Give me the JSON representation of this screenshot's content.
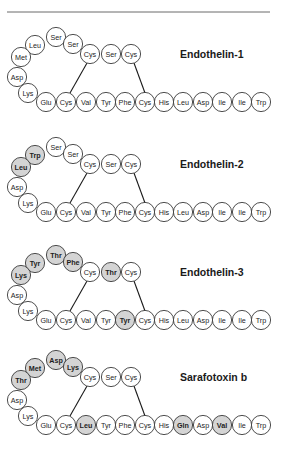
{
  "figure": {
    "top_rule": {
      "x1": 7,
      "x2": 270,
      "y": 12
    },
    "colors": {
      "shaded_fill": "#d4d4d4",
      "plain_fill": "#ffffff",
      "outline": "#3a3a3a"
    },
    "residue_radius": 9.6,
    "layout": {
      "loop_positions": [
        [
          56,
          -17
        ],
        [
          35,
          -9
        ],
        [
          21,
          3
        ],
        [
          17,
          23
        ],
        [
          28,
          39
        ],
        [
          46,
          48
        ]
      ],
      "top_positions": [
        [
          73,
          -10
        ],
        [
          90,
          0
        ],
        [
          111,
          0
        ],
        [
          131,
          0
        ]
      ],
      "bottom_x": [
        66,
        86,
        106,
        125,
        145,
        164,
        183,
        203,
        222,
        242,
        261
      ],
      "bottom_dy": 48,
      "bonds": [
        [
          [
            87,
            9
          ],
          [
            70,
            39
          ]
        ],
        [
          [
            134,
            9
          ],
          [
            145,
            39
          ]
        ]
      ],
      "title_x": 180
    },
    "peptides": [
      {
        "name": "Endothelin-1",
        "top_y": 54,
        "loop": [
          {
            "aa": "Ser",
            "shaded": false
          },
          {
            "aa": "Leu",
            "shaded": false
          },
          {
            "aa": "Met",
            "shaded": false
          },
          {
            "aa": "Asp",
            "shaded": false
          },
          {
            "aa": "Lys",
            "shaded": false
          },
          {
            "aa": "Glu",
            "shaded": false
          }
        ],
        "top": [
          {
            "aa": "Ser",
            "shaded": false
          },
          {
            "aa": "Cys",
            "shaded": false
          },
          {
            "aa": "Ser",
            "shaded": false
          },
          {
            "aa": "Cys",
            "shaded": false
          }
        ],
        "bottom": [
          {
            "aa": "Cys",
            "shaded": false
          },
          {
            "aa": "Val",
            "shaded": false
          },
          {
            "aa": "Tyr",
            "shaded": false
          },
          {
            "aa": "Phe",
            "shaded": false
          },
          {
            "aa": "Cys",
            "shaded": false
          },
          {
            "aa": "His",
            "shaded": false
          },
          {
            "aa": "Leu",
            "shaded": false
          },
          {
            "aa": "Asp",
            "shaded": false
          },
          {
            "aa": "Ile",
            "shaded": false
          },
          {
            "aa": "Ile",
            "shaded": false
          },
          {
            "aa": "Trp",
            "shaded": false
          }
        ]
      },
      {
        "name": "Endothelin-2",
        "top_y": 164,
        "loop": [
          {
            "aa": "Ser",
            "shaded": false
          },
          {
            "aa": "Trp",
            "shaded": true
          },
          {
            "aa": "Leu",
            "shaded": true
          },
          {
            "aa": "Asp",
            "shaded": false
          },
          {
            "aa": "Lys",
            "shaded": false
          },
          {
            "aa": "Glu",
            "shaded": false
          }
        ],
        "top": [
          {
            "aa": "Ser",
            "shaded": false
          },
          {
            "aa": "Cys",
            "shaded": false
          },
          {
            "aa": "Ser",
            "shaded": false
          },
          {
            "aa": "Cys",
            "shaded": false
          }
        ],
        "bottom": [
          {
            "aa": "Cys",
            "shaded": false
          },
          {
            "aa": "Val",
            "shaded": false
          },
          {
            "aa": "Tyr",
            "shaded": false
          },
          {
            "aa": "Phe",
            "shaded": false
          },
          {
            "aa": "Cys",
            "shaded": false
          },
          {
            "aa": "His",
            "shaded": false
          },
          {
            "aa": "Leu",
            "shaded": false
          },
          {
            "aa": "Asp",
            "shaded": false
          },
          {
            "aa": "Ile",
            "shaded": false
          },
          {
            "aa": "Ile",
            "shaded": false
          },
          {
            "aa": "Trp",
            "shaded": false
          }
        ]
      },
      {
        "name": "Endothelin-3",
        "top_y": 272,
        "loop": [
          {
            "aa": "Thr",
            "shaded": true
          },
          {
            "aa": "Tyr",
            "shaded": true
          },
          {
            "aa": "Lys",
            "shaded": true
          },
          {
            "aa": "Asp",
            "shaded": false
          },
          {
            "aa": "Lys",
            "shaded": false
          },
          {
            "aa": "Glu",
            "shaded": false
          }
        ],
        "top": [
          {
            "aa": "Phe",
            "shaded": true
          },
          {
            "aa": "Cys",
            "shaded": false
          },
          {
            "aa": "Thr",
            "shaded": true
          },
          {
            "aa": "Cys",
            "shaded": false
          }
        ],
        "bottom": [
          {
            "aa": "Cys",
            "shaded": false
          },
          {
            "aa": "Val",
            "shaded": false
          },
          {
            "aa": "Tyr",
            "shaded": false
          },
          {
            "aa": "Tyr",
            "shaded": true
          },
          {
            "aa": "Cys",
            "shaded": false
          },
          {
            "aa": "His",
            "shaded": false
          },
          {
            "aa": "Leu",
            "shaded": false
          },
          {
            "aa": "Asp",
            "shaded": false
          },
          {
            "aa": "Ile",
            "shaded": false
          },
          {
            "aa": "Ile",
            "shaded": false
          },
          {
            "aa": "Trp",
            "shaded": false
          }
        ]
      },
      {
        "name": "Sarafotoxin b",
        "top_y": 377,
        "loop": [
          {
            "aa": "Asp",
            "shaded": true
          },
          {
            "aa": "Met",
            "shaded": true
          },
          {
            "aa": "Thr",
            "shaded": true
          },
          {
            "aa": "Asp",
            "shaded": false
          },
          {
            "aa": "Lys",
            "shaded": false
          },
          {
            "aa": "Glu",
            "shaded": false
          }
        ],
        "top": [
          {
            "aa": "Lys",
            "shaded": true
          },
          {
            "aa": "Cys",
            "shaded": false
          },
          {
            "aa": "Ser",
            "shaded": false
          },
          {
            "aa": "Cys",
            "shaded": false
          }
        ],
        "bottom": [
          {
            "aa": "Cys",
            "shaded": false
          },
          {
            "aa": "Leu",
            "shaded": true
          },
          {
            "aa": "Tyr",
            "shaded": false
          },
          {
            "aa": "Phe",
            "shaded": false
          },
          {
            "aa": "Cys",
            "shaded": false
          },
          {
            "aa": "His",
            "shaded": false
          },
          {
            "aa": "Gln",
            "shaded": true
          },
          {
            "aa": "Asp",
            "shaded": false
          },
          {
            "aa": "Val",
            "shaded": true
          },
          {
            "aa": "Ile",
            "shaded": false
          },
          {
            "aa": "Trp",
            "shaded": false
          }
        ]
      }
    ]
  }
}
